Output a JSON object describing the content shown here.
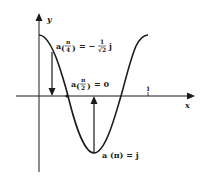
{
  "diagram": {
    "axes": {
      "x_label": "x",
      "y_label": "y",
      "x_tick_label": "1"
    },
    "curve": {
      "description": "cosine wave a(x) vs x",
      "color": "#1a1a1a"
    },
    "annotations": {
      "pi_over_4": {
        "prefix": "a",
        "arg_num": "π",
        "arg_den": "4",
        "eq": "= −",
        "frac_num": "1",
        "frac_den": "√2",
        "suffix": "j"
      },
      "pi_over_2": {
        "prefix": "a",
        "arg_num": "π",
        "arg_den": "2",
        "eq": "= 0"
      },
      "pi": {
        "text": "a (π) = j"
      }
    }
  }
}
